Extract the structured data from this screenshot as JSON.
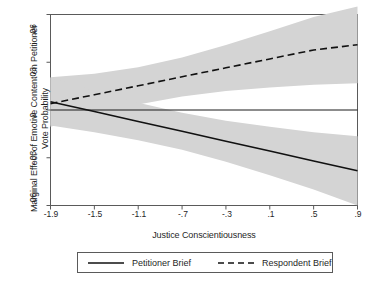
{
  "chart_data": {
    "type": "line",
    "title": "",
    "xlabel": "Justice Conscientiousness",
    "ylabel": "Marginal Effect of Emotive Content on Petitioner Vote Probability",
    "xlim": [
      -1.9,
      0.9
    ],
    "ylim": [
      -0.06,
      0.06
    ],
    "grid": false,
    "legend_position": "below-plot",
    "xticks": [
      "-1.9",
      "-1.5",
      "-1.1",
      "-.7",
      "-.3",
      ".1",
      ".5",
      ".9"
    ],
    "xtick_values": [
      -1.9,
      -1.5,
      -1.1,
      -0.7,
      -0.3,
      0.1,
      0.5,
      0.9
    ],
    "yticks": [
      ".06",
      ".03",
      "0",
      "-.03",
      "-.06"
    ],
    "ytick_values": [
      0.06,
      0.03,
      0,
      -0.03,
      -0.06
    ],
    "zero_reference_line": 0,
    "band_color": "#d4d4d4",
    "line_color": "#1a1a1a",
    "series": [
      {
        "name": "Petitioner Brief",
        "style": "solid",
        "x": [
          -1.9,
          -1.5,
          -1.1,
          -0.7,
          -0.3,
          0.1,
          0.5,
          0.9
        ],
        "values": [
          0.0052,
          -0.001,
          -0.0072,
          -0.0134,
          -0.0196,
          -0.0258,
          -0.032,
          -0.0382
        ],
        "ci_lower": [
          -0.0098,
          -0.014,
          -0.019,
          -0.025,
          -0.0325,
          -0.041,
          -0.05,
          -0.06
        ],
        "ci_upper": [
          0.0203,
          0.012,
          0.0046,
          -0.0018,
          -0.0068,
          -0.0106,
          -0.014,
          -0.0165
        ]
      },
      {
        "name": "Respondent Brief",
        "style": "dashed",
        "x": [
          -1.9,
          -1.5,
          -1.1,
          -0.7,
          -0.3,
          0.1,
          0.5,
          0.9
        ],
        "values": [
          0.004,
          0.0096,
          0.0152,
          0.0209,
          0.0265,
          0.0321,
          0.0377,
          0.041
        ],
        "ci_lower": [
          -0.0105,
          -0.0032,
          0.0035,
          0.0085,
          0.012,
          0.0142,
          0.0158,
          0.0168
        ],
        "ci_upper": [
          0.0206,
          0.0228,
          0.0268,
          0.033,
          0.0408,
          0.0495,
          0.0585,
          0.065
        ]
      }
    ]
  },
  "legend": {
    "entries": [
      {
        "label": "Petitioner Brief",
        "style": "solid"
      },
      {
        "label": "Respondent Brief",
        "style": "dashed"
      }
    ]
  },
  "axes": {
    "x_title": "Justice Conscientiousness",
    "y_title": "Marginal Effect of Emotive Content on Petitioner Vote Probability"
  }
}
